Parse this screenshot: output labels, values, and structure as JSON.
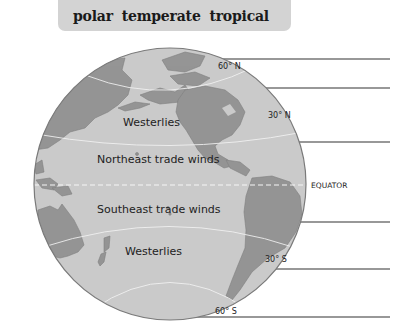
{
  "word_bank": {
    "items": [
      "polar",
      "temperate",
      "tropical"
    ],
    "background": "#d3d3d3"
  },
  "globe": {
    "ocean_color": "#cacaca",
    "land_color": "#959595",
    "edge_color": "#7a7a7a",
    "latitude_labels": {
      "n60": "60° N",
      "n30": "30° N",
      "equator": "EQUATOR",
      "s30": "30° S",
      "s60": "60° S"
    },
    "wind_belts": {
      "north_westerlies": "Westerlies",
      "northeast_trades": "Northeast trade winds",
      "southeast_trades": "Southeast trade winds",
      "south_westerlies": "Westerlies"
    }
  },
  "answer_lines": {
    "count": 6,
    "color": "#333333"
  }
}
